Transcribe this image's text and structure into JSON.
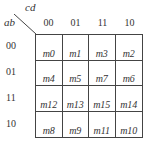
{
  "kmap": {
    "row_var": "ab",
    "col_var": "cd",
    "col_headers": [
      "00",
      "01",
      "11",
      "10"
    ],
    "row_headers": [
      "00",
      "01",
      "11",
      "10"
    ],
    "cells": [
      [
        "m0",
        "m1",
        "m3",
        "m2"
      ],
      [
        "m4",
        "m5",
        "m7",
        "m6"
      ],
      [
        "m12",
        "m13",
        "m15",
        "m14"
      ],
      [
        "m8",
        "m9",
        "m11",
        "m10"
      ]
    ]
  }
}
